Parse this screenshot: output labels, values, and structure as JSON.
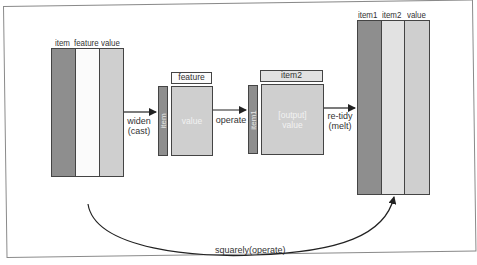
{
  "diagram": {
    "source_table": {
      "headers": [
        "item",
        "feature",
        "value"
      ]
    },
    "widen_step": {
      "label_line1": "widen",
      "label_line2": "(cast)"
    },
    "wide_matrix": {
      "row_label": "item",
      "col_header": "feature",
      "cell_label": "value"
    },
    "operate_step": {
      "label": "operate"
    },
    "result_matrix": {
      "row_label": "item1",
      "col_header": "item2",
      "cell_label_line1": "[output]",
      "cell_label_line2": "value"
    },
    "retidy_step": {
      "label_line1": "re-tidy",
      "label_line2": "(melt)"
    },
    "final_table": {
      "headers": [
        "item1",
        "item2",
        "value"
      ]
    },
    "shortcut": {
      "label": "squarely(operate)"
    },
    "colors": {
      "dark_column": "#8e8e8e",
      "light_column": "#cfcfcf",
      "white_column": "#fbfbfb",
      "lighter_column": "#e2e2e2",
      "stroke": "#444444"
    }
  }
}
